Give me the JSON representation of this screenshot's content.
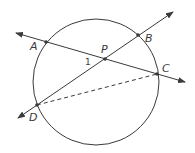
{
  "diagram": {
    "type": "circle-with-intersecting-chords",
    "points": {
      "A": "A",
      "B": "B",
      "C": "C",
      "D": "D",
      "P": "P"
    },
    "angle_label": "1",
    "lines": [
      {
        "name": "line-AC",
        "through": [
          "A",
          "P",
          "C"
        ],
        "style": "solid",
        "arrows": "both"
      },
      {
        "name": "line-DB",
        "through": [
          "D",
          "P",
          "B"
        ],
        "style": "solid",
        "arrows": "both"
      },
      {
        "name": "segment-DC",
        "through": [
          "D",
          "C"
        ],
        "style": "dashed",
        "arrows": "none"
      }
    ],
    "colors": {
      "stroke": "#3a3a3a"
    }
  }
}
